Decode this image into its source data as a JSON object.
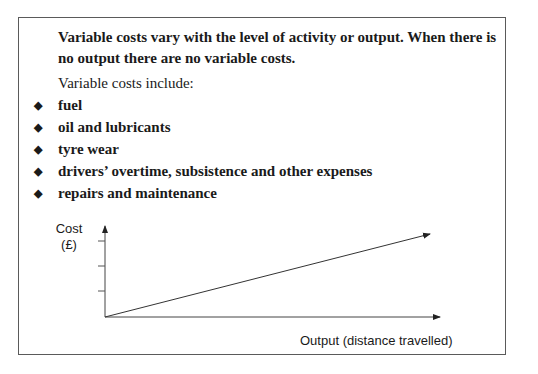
{
  "intro": "Variable costs vary with the level of activity or output. When there is no output there are no variable costs.",
  "include_label": "Variable costs include:",
  "bullet_glyph": "◆",
  "items": [
    "fuel",
    "oil and lubricants",
    "tyre wear",
    "drivers’ overtime, subsistence and other expenses",
    "repairs and maintenance"
  ],
  "diagram": {
    "y_label_line1": "Cost",
    "y_label_line2": "(£)",
    "x_label": "Output (distance travelled)",
    "line_description": "Straight line from origin rising with output (variable costs)"
  }
}
